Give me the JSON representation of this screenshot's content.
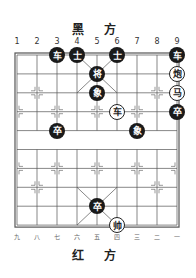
{
  "top_title": "黑 方",
  "bottom_title": "红 方",
  "top_numbers": [
    "1",
    "2",
    "3",
    "4",
    "5",
    "6",
    "7",
    "8",
    "9"
  ],
  "bottom_numbers": [
    "九",
    "八",
    "七",
    "六",
    "五",
    "四",
    "三",
    "二",
    "一"
  ],
  "board": {
    "left": 17,
    "top": 55,
    "dx": 20,
    "dy": 18.9,
    "cols": 9,
    "rows": 10
  },
  "pieces": [
    {
      "label": "车",
      "side": "black",
      "col": 3,
      "row": 0
    },
    {
      "label": "士",
      "side": "black",
      "col": 4,
      "row": 0
    },
    {
      "label": "士",
      "side": "black",
      "col": 6,
      "row": 0
    },
    {
      "label": "车",
      "side": "black",
      "col": 9,
      "row": 0
    },
    {
      "label": "将",
      "side": "black",
      "col": 5,
      "row": 1
    },
    {
      "label": "炮",
      "side": "red",
      "col": 9,
      "row": 1
    },
    {
      "label": "象",
      "side": "black",
      "col": 5,
      "row": 2
    },
    {
      "label": "马",
      "side": "red",
      "col": 9,
      "row": 2
    },
    {
      "label": "车",
      "side": "red",
      "col": 6,
      "row": 3
    },
    {
      "label": "卒",
      "side": "black",
      "col": 9,
      "row": 3
    },
    {
      "label": "卒",
      "side": "black",
      "col": 3,
      "row": 4
    },
    {
      "label": "象",
      "side": "black",
      "col": 7,
      "row": 4
    },
    {
      "label": "卒",
      "side": "black",
      "col": 5,
      "row": 8
    },
    {
      "label": "帅",
      "side": "red",
      "col": 6,
      "row": 9
    }
  ]
}
